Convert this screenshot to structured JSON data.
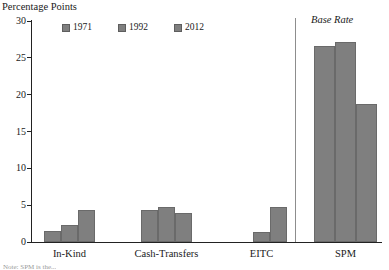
{
  "chart_data": {
    "type": "bar",
    "title": "",
    "ylabel": "Percentage Points",
    "xlabel": "",
    "ylim": [
      0,
      30
    ],
    "yticks": [
      0,
      5,
      10,
      15,
      20,
      25,
      30
    ],
    "ytick_labels": [
      "0",
      "5",
      "10",
      "15",
      "20",
      "25",
      "30"
    ],
    "grid": false,
    "legend_position": "top-left",
    "categories": [
      "In-Kind",
      "Cash-Transfers",
      "EITC",
      "SPM"
    ],
    "series": [
      {
        "name": "1971",
        "values": [
          1.5,
          4.3,
          0.0,
          26.6
        ]
      },
      {
        "name": "1992",
        "values": [
          2.3,
          4.7,
          1.3,
          27.2
        ]
      },
      {
        "name": "2012",
        "values": [
          4.4,
          4.0,
          4.8,
          18.7
        ]
      }
    ],
    "annotations": [
      {
        "text": "Base Rate",
        "style": "italic",
        "position": "above-spm-panel"
      }
    ],
    "divider": {
      "after_category": "EITC",
      "style": "vertical-line"
    },
    "bar_color": "#7f7f7f",
    "bar_border_color": "#6a6a6a",
    "axis_color": "#222222"
  },
  "legend": {
    "entries": [
      {
        "label": "1971",
        "color": "#7f7f7f"
      },
      {
        "label": "1992",
        "color": "#7f7f7f"
      },
      {
        "label": "2012",
        "color": "#7f7f7f"
      }
    ]
  },
  "annotation": {
    "base_rate": "Base Rate"
  },
  "axis": {
    "y_title": "Percentage Points"
  },
  "footer": {
    "source_note": "Note: SPM is the..."
  }
}
